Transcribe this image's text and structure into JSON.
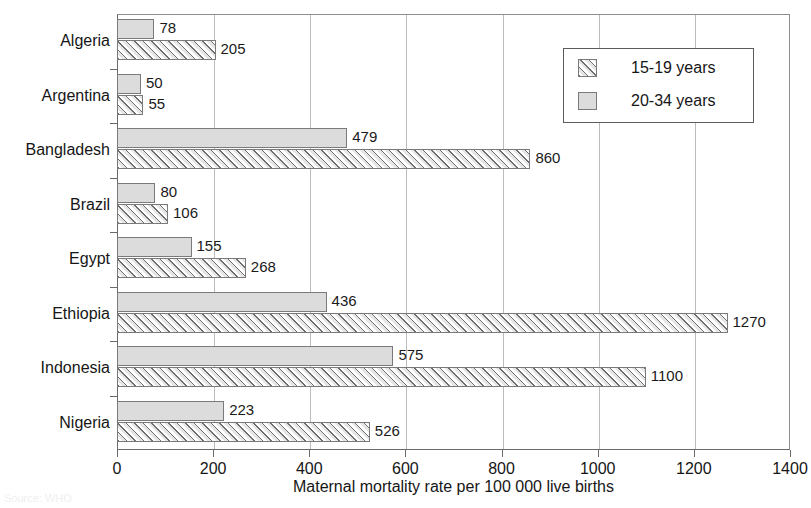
{
  "chart_data": {
    "type": "bar",
    "orientation": "horizontal",
    "title": "",
    "xlabel": "Maternal mortality rate per 100 000 live births",
    "ylabel": "",
    "xlim": [
      0,
      1400
    ],
    "xticks": [
      0,
      200,
      400,
      600,
      800,
      1000,
      1200,
      1400
    ],
    "xticklabels": [
      "0",
      "200",
      "400",
      "600",
      "800",
      "1000",
      "1200",
      "1400"
    ],
    "grid": "vertical",
    "categories": [
      "Algeria",
      "Argentina",
      "Bangladesh",
      "Brazil",
      "Egypt",
      "Ethiopia",
      "Indonesia",
      "Nigeria"
    ],
    "series": [
      {
        "name": "20-34 years",
        "pattern": "solid",
        "color": "#dcdcdc",
        "values": [
          78,
          50,
          479,
          80,
          155,
          436,
          575,
          223
        ]
      },
      {
        "name": "15-19 years",
        "pattern": "hatched",
        "color": "#e6e6e6",
        "values": [
          205,
          55,
          860,
          106,
          268,
          1270,
          1100,
          526
        ]
      }
    ],
    "legend": {
      "position": "top-right",
      "entries": [
        {
          "label": "15-19 years",
          "pattern": "hatched"
        },
        {
          "label": "20-34 years",
          "pattern": "solid"
        }
      ]
    },
    "data_labels_shown": true
  },
  "source_note": "Source: WHO"
}
